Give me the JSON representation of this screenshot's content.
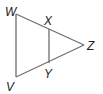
{
  "diagram": {
    "type": "geometry-triangle",
    "colors": {
      "line": "#6e6e6e",
      "label": "#222222",
      "background": "#ffffff"
    },
    "points": {
      "W": {
        "label": "W",
        "x": 16,
        "y": 14
      },
      "X": {
        "label": "X",
        "x": 49,
        "y": 29
      },
      "Z": {
        "label": "Z",
        "x": 84,
        "y": 45
      },
      "Y": {
        "label": "Y",
        "x": 49,
        "y": 63
      },
      "V": {
        "label": "V",
        "x": 16,
        "y": 77
      }
    },
    "segments": [
      {
        "name": "WZ",
        "from": "W",
        "to": "Z"
      },
      {
        "name": "VZ",
        "from": "V",
        "to": "Z"
      },
      {
        "name": "WV",
        "from": "W",
        "to": "V"
      },
      {
        "name": "XY",
        "from": "X",
        "to": "Y"
      }
    ]
  }
}
